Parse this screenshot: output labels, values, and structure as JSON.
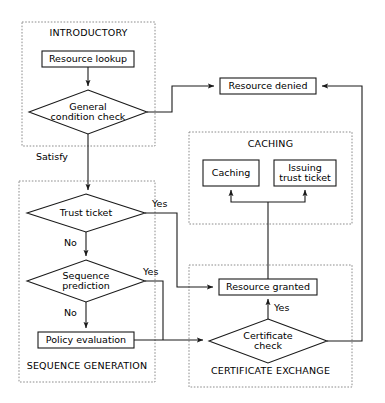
{
  "diagram": {
    "colors": {
      "stroke": "#1a1a1a",
      "group_stroke": "#8c8c8c",
      "background": "#ffffff",
      "text": "#000000"
    },
    "groups": [
      {
        "id": "introductory",
        "label": "INTRODUCTORY",
        "x": 22,
        "y": 22,
        "w": 133,
        "h": 124
      },
      {
        "id": "sequence_generation",
        "label": "SEQUENCE GENERATION",
        "x": 19,
        "y": 181,
        "w": 136,
        "h": 201
      },
      {
        "id": "caching",
        "label": "CACHING",
        "x": 189,
        "y": 132,
        "w": 163,
        "h": 92
      },
      {
        "id": "certificate_exchange",
        "label": "CERTIFICATE EXCHANGE",
        "x": 189,
        "y": 265,
        "w": 163,
        "h": 122
      }
    ],
    "nodes": [
      {
        "id": "resource_lookup",
        "label": "Resource lookup",
        "shape": "box",
        "cx": 88,
        "cy": 59,
        "w": 92,
        "h": 16
      },
      {
        "id": "general_condition",
        "label": "General\ncondition check",
        "shape": "diamond",
        "cx": 88,
        "cy": 112,
        "w": 118,
        "h": 44
      },
      {
        "id": "resource_denied",
        "label": "Resource denied",
        "shape": "box",
        "cx": 268,
        "cy": 86,
        "w": 96,
        "h": 16
      },
      {
        "id": "caching_box",
        "label": "Caching",
        "shape": "box",
        "cx": 231,
        "cy": 173,
        "w": 56,
        "h": 26
      },
      {
        "id": "issuing_trust_ticket",
        "label": "Issuing\ntrust ticket",
        "shape": "box",
        "cx": 305,
        "cy": 173,
        "w": 62,
        "h": 26
      },
      {
        "id": "trust_ticket",
        "label": "Trust ticket",
        "shape": "diamond",
        "cx": 86,
        "cy": 213,
        "w": 118,
        "h": 38
      },
      {
        "id": "sequence_prediction",
        "label": "Sequence\nprediction",
        "shape": "diamond",
        "cx": 86,
        "cy": 281,
        "w": 118,
        "h": 42
      },
      {
        "id": "policy_evaluation",
        "label": "Policy evaluation",
        "shape": "box",
        "cx": 86,
        "cy": 340,
        "w": 96,
        "h": 16
      },
      {
        "id": "resource_granted",
        "label": "Resource granted",
        "shape": "box",
        "cx": 268,
        "cy": 287,
        "w": 98,
        "h": 16
      },
      {
        "id": "certificate_check",
        "label": "Certificate\ncheck",
        "shape": "diamond",
        "cx": 268,
        "cy": 341,
        "w": 118,
        "h": 44
      }
    ],
    "edges": [
      {
        "id": "lookup-to-condition",
        "from": "resource_lookup",
        "to": "general_condition"
      },
      {
        "id": "condition-to-denied",
        "from": "general_condition",
        "to": "resource_denied"
      },
      {
        "id": "condition-to-trust-ticket",
        "from": "general_condition",
        "to": "trust_ticket",
        "label": "Satisfy"
      },
      {
        "id": "trust-ticket-yes-to-granted",
        "from": "trust_ticket",
        "to": "resource_granted",
        "label": "Yes"
      },
      {
        "id": "trust-ticket-no-to-sequence",
        "from": "trust_ticket",
        "to": "sequence_prediction",
        "label": "No"
      },
      {
        "id": "sequence-yes-to-certificate",
        "from": "sequence_prediction",
        "to": "certificate_check",
        "label": "Yes"
      },
      {
        "id": "sequence-no-to-policy",
        "from": "sequence_prediction",
        "to": "policy_evaluation",
        "label": "No"
      },
      {
        "id": "policy-to-certificate",
        "from": "policy_evaluation",
        "to": "certificate_check"
      },
      {
        "id": "certificate-yes-to-granted",
        "from": "certificate_check",
        "to": "resource_granted",
        "label": "Yes"
      },
      {
        "id": "certificate-no-to-denied",
        "from": "certificate_check",
        "to": "resource_denied"
      },
      {
        "id": "granted-to-caching",
        "from": "resource_granted",
        "to": "caching_box"
      },
      {
        "id": "granted-to-issuing",
        "from": "resource_granted",
        "to": "issuing_trust_ticket"
      }
    ],
    "edge_labels": {
      "satisfy": "Satisfy",
      "trust_ticket_yes": "Yes",
      "trust_ticket_no": "No",
      "sequence_yes": "Yes",
      "sequence_no": "No",
      "certificate_yes": "Yes"
    }
  }
}
